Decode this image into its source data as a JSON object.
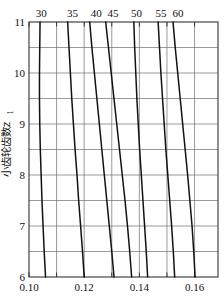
{
  "figure": {
    "name": "pinion-teeth-coefficient-nomogram",
    "background_color": "#ffffff",
    "line_color": "#111111",
    "grid_color": "#6e6e6e",
    "frame_color": "#333333"
  },
  "chart_data": {
    "type": "line",
    "title": "",
    "subtitle": "",
    "xlabel": "",
    "ylabel": "小齿轮齿数z",
    "ylabel_subscript": "1",
    "xlim": [
      0.1,
      0.1685
    ],
    "ylim": [
      6,
      11
    ],
    "grid": true,
    "grid_x_step": 0.01,
    "grid_y_step": 0.5,
    "legend_position": "top",
    "x_ticks": [
      0.1,
      0.11,
      0.12,
      0.13,
      0.14,
      0.15,
      0.16
    ],
    "x_tick_labels": [
      "0.10",
      "",
      "0.12",
      "",
      "0.14",
      "",
      "0.16"
    ],
    "y_ticks": [
      6,
      6.5,
      7,
      7.5,
      8,
      8.5,
      9,
      9.5,
      10,
      10.5,
      11
    ],
    "y_tick_labels": [
      "6",
      "",
      "7",
      "",
      "8",
      "",
      "9",
      "",
      "10",
      "",
      "11"
    ],
    "series": [
      {
        "name": "30",
        "label": "30",
        "label_x": 0.1044,
        "x": [
          0.104,
          0.1039,
          0.1038,
          0.1038,
          0.1039,
          0.1041,
          0.1044,
          0.1047,
          0.1051,
          0.1055,
          0.106
        ],
        "y": [
          11.0,
          10.5,
          10.0,
          9.5,
          9.0,
          8.5,
          8.0,
          7.5,
          7.0,
          6.5,
          6.0
        ]
      },
      {
        "name": "35",
        "label": "35",
        "label_x": 0.1158,
        "x": [
          0.114,
          0.1145,
          0.115,
          0.1155,
          0.1161,
          0.1167,
          0.1174,
          0.118,
          0.1187,
          0.1194,
          0.12
        ],
        "y": [
          11.0,
          10.5,
          10.0,
          9.5,
          9.0,
          8.5,
          8.0,
          7.5,
          7.0,
          6.5,
          6.0
        ]
      },
      {
        "name": "40",
        "label": "40",
        "label_x": 0.1244,
        "x": [
          0.122,
          0.1228,
          0.1237,
          0.1246,
          0.1255,
          0.1264,
          0.1273,
          0.1282,
          0.1291,
          0.13,
          0.1308
        ],
        "y": [
          11.0,
          10.5,
          10.0,
          9.5,
          9.0,
          8.5,
          8.0,
          7.5,
          7.0,
          6.5,
          6.0
        ]
      },
      {
        "name": "45",
        "label": "45",
        "label_x": 0.1304,
        "x": [
          0.1278,
          0.1288,
          0.1298,
          0.1308,
          0.1318,
          0.1328,
          0.1338,
          0.1348,
          0.1357,
          0.1365,
          0.1372
        ],
        "y": [
          11.0,
          10.5,
          10.0,
          9.5,
          9.0,
          8.5,
          8.0,
          7.5,
          7.0,
          6.5,
          6.0
        ]
      },
      {
        "name": "50",
        "label": "50",
        "label_x": 0.139,
        "x": [
          0.138,
          0.1383,
          0.1387,
          0.1391,
          0.1396,
          0.1401,
          0.1407,
          0.1413,
          0.1419,
          0.1425,
          0.143
        ],
        "y": [
          11.0,
          10.5,
          10.0,
          9.5,
          9.0,
          8.5,
          8.0,
          7.5,
          7.0,
          6.5,
          6.0
        ]
      },
      {
        "name": "55",
        "label": "55",
        "label_x": 0.1478,
        "x": [
          0.1468,
          0.1473,
          0.1478,
          0.1484,
          0.149,
          0.1496,
          0.1503,
          0.151,
          0.1517,
          0.1523,
          0.1528
        ],
        "y": [
          11.0,
          10.5,
          10.0,
          9.5,
          9.0,
          8.5,
          8.0,
          7.5,
          7.0,
          6.5,
          6.0
        ]
      },
      {
        "name": "60",
        "label": "60",
        "label_x": 0.154,
        "x": [
          0.1522,
          0.153,
          0.1539,
          0.1548,
          0.1557,
          0.1566,
          0.1575,
          0.1583,
          0.1591,
          0.1597,
          0.1602
        ],
        "y": [
          11.0,
          10.5,
          10.0,
          9.5,
          9.0,
          8.5,
          8.0,
          7.5,
          7.0,
          6.5,
          6.0
        ]
      }
    ]
  }
}
